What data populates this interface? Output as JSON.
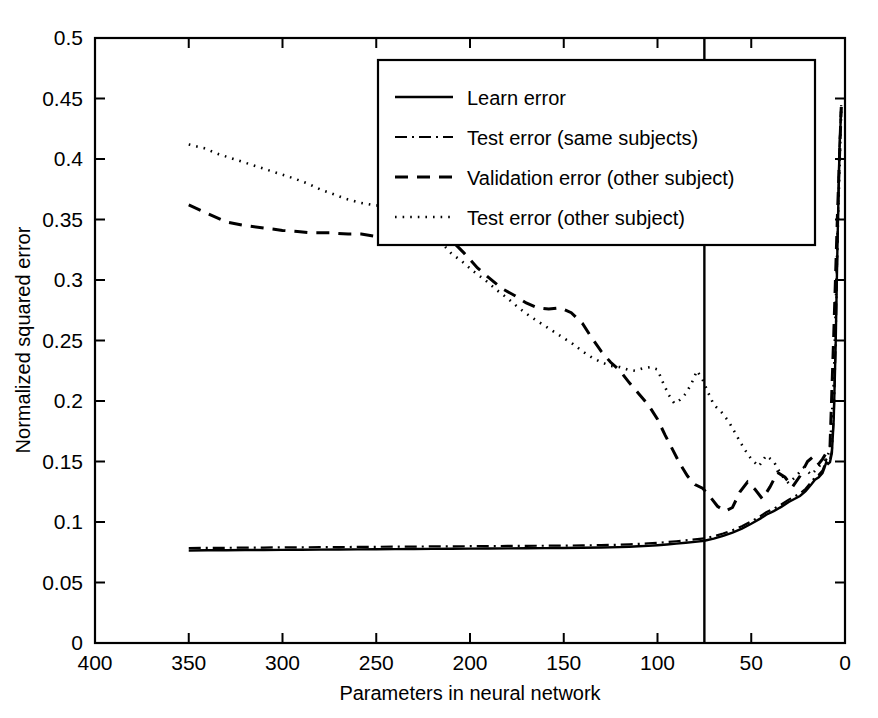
{
  "chart_data": {
    "type": "line",
    "title": "",
    "xlabel": "Parameters in neural network",
    "ylabel": "Normalized squared error",
    "xlim": [
      400,
      0
    ],
    "ylim": [
      0,
      0.5
    ],
    "x_reversed": true,
    "grid": false,
    "legend_position": "top-center",
    "xticks": [
      400,
      350,
      300,
      250,
      200,
      150,
      100,
      50,
      0
    ],
    "xtick_labels": [
      "400",
      "350",
      "300",
      "250",
      "200",
      "150",
      "100",
      "50",
      "0"
    ],
    "yticks": [
      0,
      0.05,
      0.1,
      0.15,
      0.2,
      0.25,
      0.3,
      0.35,
      0.4,
      0.45,
      0.5
    ],
    "ytick_labels": [
      "0",
      "0.05",
      "0.1",
      "0.15",
      "0.2",
      "0.25",
      "0.3",
      "0.35",
      "0.4",
      "0.45",
      "0.5"
    ],
    "annotations": [
      {
        "name": "selected-model-marker",
        "type": "vline",
        "x": 75,
        "label": ""
      }
    ],
    "series": [
      {
        "name": "Learn error",
        "style": "solid",
        "x": [
          350,
          340,
          330,
          320,
          310,
          300,
          290,
          280,
          270,
          260,
          250,
          240,
          230,
          220,
          210,
          200,
          190,
          180,
          170,
          160,
          150,
          140,
          130,
          120,
          115,
          110,
          105,
          100,
          95,
          90,
          85,
          80,
          75,
          70,
          65,
          60,
          55,
          50,
          45,
          42,
          38,
          34,
          30,
          27,
          24,
          21,
          18,
          16,
          14,
          12,
          11,
          10,
          9,
          8,
          7,
          6,
          5,
          4,
          3,
          2
        ],
        "values": [
          0.0765,
          0.0766,
          0.0767,
          0.0768,
          0.0769,
          0.077,
          0.0771,
          0.0772,
          0.0773,
          0.0774,
          0.0775,
          0.0776,
          0.0777,
          0.0778,
          0.0779,
          0.078,
          0.0781,
          0.0782,
          0.0783,
          0.0784,
          0.0785,
          0.0787,
          0.0789,
          0.0792,
          0.0795,
          0.0799,
          0.0803,
          0.0808,
          0.0814,
          0.0821,
          0.0828,
          0.0836,
          0.0845,
          0.0862,
          0.0885,
          0.0912,
          0.0945,
          0.0985,
          0.103,
          0.106,
          0.109,
          0.1125,
          0.1165,
          0.119,
          0.1215,
          0.1255,
          0.131,
          0.135,
          0.137,
          0.1405,
          0.1445,
          0.1495,
          0.148,
          0.1495,
          0.157,
          0.185,
          0.245,
          0.33,
          0.405,
          0.443
        ]
      },
      {
        "name": "Test error (same subjects)",
        "style": "dashdot",
        "x": [
          350,
          340,
          330,
          320,
          310,
          300,
          290,
          280,
          270,
          260,
          250,
          240,
          230,
          220,
          210,
          200,
          190,
          180,
          170,
          160,
          150,
          140,
          130,
          120,
          115,
          110,
          105,
          100,
          95,
          90,
          85,
          80,
          75,
          70,
          65,
          60,
          55,
          50,
          45,
          42,
          38,
          34,
          30,
          27,
          24,
          21,
          18,
          16,
          14,
          12,
          11,
          10,
          9,
          8,
          7,
          6,
          5,
          4,
          3,
          2
        ],
        "values": [
          0.0785,
          0.0786,
          0.0787,
          0.0788,
          0.0789,
          0.079,
          0.0791,
          0.0792,
          0.0793,
          0.0794,
          0.0795,
          0.0796,
          0.0797,
          0.0798,
          0.0799,
          0.08,
          0.0801,
          0.0802,
          0.0803,
          0.0804,
          0.0805,
          0.0807,
          0.0809,
          0.0812,
          0.0815,
          0.0819,
          0.0823,
          0.0828,
          0.0834,
          0.0841,
          0.0848,
          0.0856,
          0.0865,
          0.0882,
          0.0905,
          0.0932,
          0.0965,
          0.1005,
          0.105,
          0.108,
          0.111,
          0.1145,
          0.1185,
          0.121,
          0.1235,
          0.1275,
          0.133,
          0.137,
          0.139,
          0.1425,
          0.1465,
          0.1515,
          0.15,
          0.1515,
          0.159,
          0.187,
          0.247,
          0.332,
          0.407,
          0.4445
        ]
      },
      {
        "name": "Validation error (other subject)",
        "style": "dashed",
        "x": [
          350,
          340,
          330,
          320,
          310,
          300,
          292,
          285,
          275,
          265,
          258,
          250,
          245,
          240,
          232,
          225,
          218,
          210,
          203,
          196,
          190,
          183,
          176,
          170,
          164,
          158,
          152,
          146,
          140,
          135,
          130,
          125,
          120,
          115,
          110,
          105,
          100,
          96,
          92,
          88,
          84,
          80,
          76,
          72,
          68,
          64,
          60,
          56,
          52,
          48,
          44,
          40,
          36,
          32,
          28,
          24,
          20,
          17,
          14,
          12,
          10,
          8,
          6,
          4,
          2
        ],
        "values": [
          0.362,
          0.355,
          0.348,
          0.345,
          0.343,
          0.341,
          0.34,
          0.339,
          0.339,
          0.338,
          0.338,
          0.336,
          0.334,
          0.337,
          0.346,
          0.35,
          0.342,
          0.333,
          0.322,
          0.31,
          0.302,
          0.293,
          0.287,
          0.281,
          0.277,
          0.276,
          0.277,
          0.273,
          0.264,
          0.252,
          0.241,
          0.232,
          0.225,
          0.215,
          0.206,
          0.197,
          0.185,
          0.172,
          0.16,
          0.148,
          0.138,
          0.131,
          0.128,
          0.121,
          0.113,
          0.109,
          0.112,
          0.125,
          0.133,
          0.127,
          0.119,
          0.129,
          0.141,
          0.137,
          0.129,
          0.138,
          0.15,
          0.154,
          0.148,
          0.152,
          0.157,
          0.162,
          0.255,
          0.355,
          0.443
        ]
      },
      {
        "name": "Test error (other subject)",
        "style": "dotted",
        "x": [
          350,
          342,
          334,
          326,
          318,
          310,
          302,
          294,
          287,
          280,
          273,
          266,
          259,
          252,
          246,
          240,
          234,
          228,
          222,
          216,
          210,
          204,
          198,
          192,
          186,
          180,
          174,
          168,
          162,
          156,
          150,
          145,
          140,
          135,
          130,
          125,
          120,
          116,
          112,
          108,
          104,
          100,
          97,
          94,
          91,
          88,
          85,
          82,
          79,
          76,
          73,
          70,
          66,
          62,
          58,
          54,
          50,
          46,
          42,
          38,
          34,
          30,
          26,
          22,
          18,
          15,
          12,
          10,
          8,
          6,
          4,
          2
        ],
        "values": [
          0.412,
          0.409,
          0.404,
          0.4,
          0.396,
          0.392,
          0.388,
          0.384,
          0.38,
          0.375,
          0.371,
          0.367,
          0.364,
          0.362,
          0.361,
          0.36,
          0.357,
          0.35,
          0.341,
          0.332,
          0.322,
          0.315,
          0.307,
          0.3,
          0.292,
          0.285,
          0.277,
          0.27,
          0.264,
          0.258,
          0.252,
          0.247,
          0.241,
          0.236,
          0.232,
          0.229,
          0.228,
          0.226,
          0.225,
          0.227,
          0.228,
          0.226,
          0.215,
          0.205,
          0.198,
          0.201,
          0.206,
          0.214,
          0.225,
          0.218,
          0.207,
          0.197,
          0.191,
          0.183,
          0.172,
          0.161,
          0.152,
          0.146,
          0.155,
          0.15,
          0.139,
          0.132,
          0.138,
          0.145,
          0.139,
          0.144,
          0.149,
          0.152,
          0.16,
          0.215,
          0.335,
          0.441
        ]
      }
    ]
  },
  "legend": {
    "items": [
      {
        "label": "Learn error",
        "style": "solid"
      },
      {
        "label": "Test error (same subjects)",
        "style": "dashdot"
      },
      {
        "label": "Validation error (other subject)",
        "style": "dashed"
      },
      {
        "label": "Test error (other subject)",
        "style": "dotted"
      }
    ]
  },
  "colors": {
    "line": "#000000",
    "background": "#ffffff",
    "axis": "#000000"
  }
}
